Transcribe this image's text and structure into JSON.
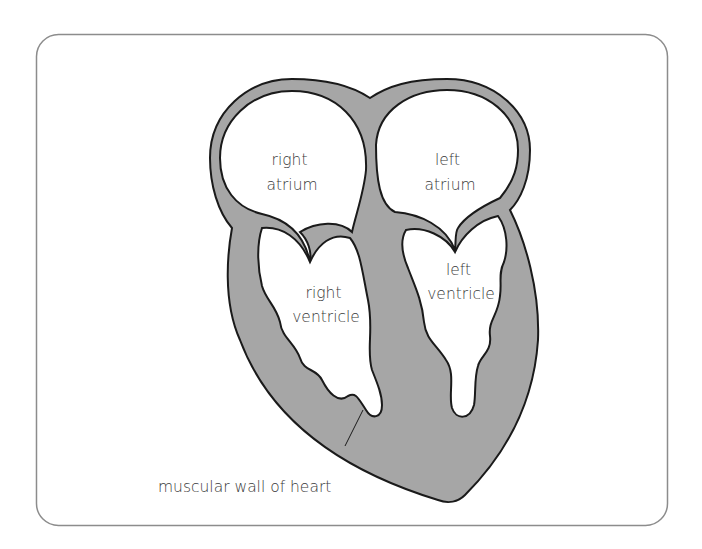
{
  "diagram": {
    "type": "anatomical-cross-section",
    "subject": "heart",
    "colors": {
      "frame": "#8c8c8c",
      "muscle_fill": "#a6a6a6",
      "outline": "#1a1a1a",
      "chamber": "#ffffff",
      "text": "#3a3a3a"
    },
    "labels": {
      "right_atrium": [
        "right",
        "atrium"
      ],
      "left_atrium": [
        "left",
        "atrium"
      ],
      "right_ventricle": [
        "right",
        "ventricle"
      ],
      "left_ventricle": [
        "left",
        "ventricle"
      ],
      "muscular_wall": "muscular wall of heart"
    }
  }
}
